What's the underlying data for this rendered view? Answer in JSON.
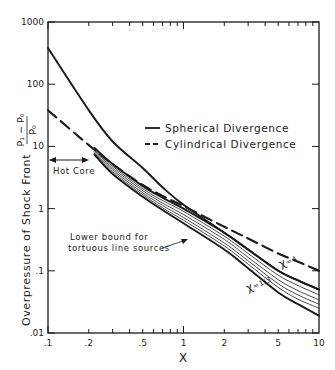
{
  "chart_data": {
    "type": "line",
    "title": "",
    "xlabel": "X",
    "ylabel": "Overpressure of Shock Front",
    "ylabel_fraction": {
      "numerator": "P₁ − P₀",
      "denominator": "P₀"
    },
    "xscale": "log",
    "yscale": "log",
    "xlim": [
      0.1,
      10
    ],
    "ylim": [
      0.01,
      1000
    ],
    "grid": false,
    "x_ticks": [
      {
        "value": 0.1,
        "label": ".1"
      },
      {
        "value": 0.2,
        "label": ".2"
      },
      {
        "value": 0.5,
        "label": ".5"
      },
      {
        "value": 1,
        "label": "1"
      },
      {
        "value": 2,
        "label": "2"
      },
      {
        "value": 5,
        "label": "5"
      },
      {
        "value": 10,
        "label": "10"
      }
    ],
    "y_ticks": [
      {
        "value": 0.01,
        "label": ".01"
      },
      {
        "value": 0.1,
        "label": ".1"
      },
      {
        "value": 1,
        "label": "1"
      },
      {
        "value": 10,
        "label": "10"
      },
      {
        "value": 100,
        "label": "100"
      },
      {
        "value": 1000,
        "label": "1000"
      }
    ],
    "legend": {
      "placement": "center-right",
      "entries": [
        {
          "label": "Spherical Divergence",
          "style": "solid"
        },
        {
          "label": "Cylindrical Divergence",
          "style": "dashed"
        }
      ]
    },
    "series": [
      {
        "name": "Spherical Divergence",
        "style": "solid",
        "weight": "bold",
        "x": [
          0.1,
          0.2,
          0.3,
          0.5,
          0.7,
          1,
          2,
          3,
          5,
          7,
          10
        ],
        "y": [
          380,
          38,
          12,
          4.5,
          2.2,
          1.15,
          0.41,
          0.22,
          0.1,
          0.07,
          0.05
        ]
      },
      {
        "name": "Cylindrical Divergence",
        "style": "dashed",
        "weight": "bold",
        "x": [
          0.1,
          0.2,
          0.3,
          0.5,
          0.7,
          1,
          2,
          3,
          5,
          7,
          10
        ],
        "y": [
          38,
          10.5,
          5.2,
          2.4,
          1.6,
          1.1,
          0.51,
          0.33,
          0.19,
          0.14,
          0.1
        ]
      },
      {
        "name": "χ = 4",
        "style": "solid",
        "weight": "bold",
        "x": [
          0.22,
          0.3,
          0.5,
          0.7,
          1,
          2,
          3,
          5,
          7,
          10
        ],
        "y": [
          9.5,
          5.2,
          2.3,
          1.5,
          1.0,
          0.41,
          0.22,
          0.1,
          0.07,
          0.05
        ]
      },
      {
        "name": "χ family 1",
        "style": "solid",
        "weight": "thin",
        "x": [
          0.22,
          0.3,
          0.5,
          0.7,
          1,
          2,
          3,
          5,
          7,
          10
        ],
        "y": [
          9.0,
          4.8,
          2.1,
          1.35,
          0.9,
          0.36,
          0.19,
          0.085,
          0.058,
          0.041
        ]
      },
      {
        "name": "χ family 2",
        "style": "solid",
        "weight": "thin",
        "x": [
          0.22,
          0.3,
          0.5,
          0.7,
          1,
          2,
          3,
          5,
          7,
          10
        ],
        "y": [
          8.6,
          4.5,
          1.95,
          1.23,
          0.8,
          0.32,
          0.165,
          0.072,
          0.048,
          0.034
        ]
      },
      {
        "name": "χ family 3",
        "style": "solid",
        "weight": "thin",
        "x": [
          0.22,
          0.3,
          0.5,
          0.7,
          1,
          2,
          3,
          5,
          7,
          10
        ],
        "y": [
          8.2,
          4.2,
          1.8,
          1.12,
          0.72,
          0.28,
          0.145,
          0.062,
          0.041,
          0.029
        ]
      },
      {
        "name": "χ family 4",
        "style": "solid",
        "weight": "thin",
        "x": [
          0.22,
          0.3,
          0.5,
          0.7,
          1,
          2,
          3,
          5,
          7,
          10
        ],
        "y": [
          7.8,
          3.9,
          1.68,
          1.03,
          0.65,
          0.25,
          0.128,
          0.054,
          0.035,
          0.025
        ]
      },
      {
        "name": "χ = 1/3",
        "style": "solid",
        "weight": "bold",
        "x": [
          0.22,
          0.3,
          0.5,
          0.7,
          1,
          2,
          3,
          5,
          7,
          10
        ],
        "y": [
          7.4,
          3.6,
          1.55,
          0.95,
          0.58,
          0.22,
          0.11,
          0.045,
          0.029,
          0.019
        ]
      }
    ],
    "annotations": [
      {
        "text": "Hot Core",
        "type": "double-arrow",
        "x_range": [
          0.1,
          0.2
        ],
        "y": 6
      },
      {
        "text": "Lower bound for",
        "x": 0.13,
        "y": 0.32
      },
      {
        "text": "tortuous line sources",
        "x": 0.13,
        "y": 0.22
      },
      {
        "text": "χ=4",
        "x": 5.2,
        "y": 0.14
      },
      {
        "text": "χ=1/3",
        "x": 2.9,
        "y": 0.07
      }
    ]
  }
}
